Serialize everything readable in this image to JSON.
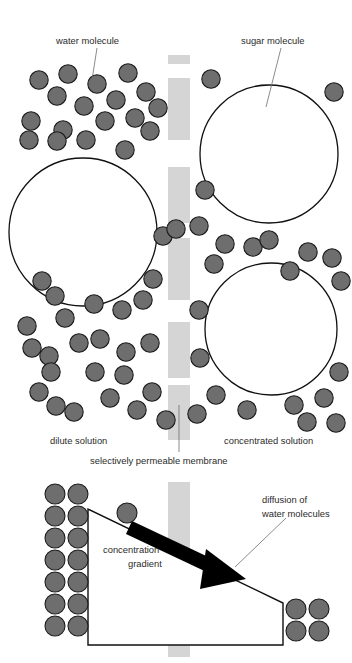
{
  "figure": {
    "canvas": {
      "width": 352,
      "height": 663,
      "background": "#ffffff"
    }
  },
  "colors": {
    "molecule_fill": "#6e6e6e",
    "molecule_stroke": "#1c1c1c",
    "membrane_fill": "#d5d5d5",
    "sugar_fill": "#ffffff",
    "sugar_stroke": "#101010",
    "arrow_fill": "#000000",
    "text": "#2b2b2b",
    "leader_line": "#6d6d6d"
  },
  "labels": {
    "water_molecule": "water molecule",
    "sugar_molecule": "sugar molecule",
    "dilute_solution": "dilute solution",
    "concentrated_solution": "concentrated solution",
    "membrane": "selectively permeable membrane",
    "concentration_gradient_line1": "concentration",
    "concentration_gradient_line2": "gradient",
    "diffusion_line1": "diffusion of",
    "diffusion_line2": "water molecules"
  },
  "top_panel": {
    "description": "Two compartments separated by a segmented selectively permeable membrane. Left compartment is dilute (many water molecules, one large sugar molecule). Right compartment is concentrated (two large sugar molecules, fewer water molecules).",
    "dilute_water_count": 44,
    "concentrated_water_count": 22,
    "dilute_sugar_count": 1,
    "concentrated_sugar_count": 2,
    "membrane_x": 168,
    "membrane_width": 22,
    "membrane_segments": [
      {
        "y": 55,
        "height": 9
      },
      {
        "y": 78,
        "height": 62
      },
      {
        "y": 167,
        "height": 56
      },
      {
        "y": 238,
        "height": 62
      },
      {
        "y": 322,
        "height": 56
      },
      {
        "y": 385,
        "height": 55
      }
    ],
    "sugar_molecules": [
      {
        "cx": 83,
        "cy": 232,
        "r": 74
      },
      {
        "cx": 269,
        "cy": 154,
        "r": 69
      },
      {
        "cx": 271,
        "cy": 329,
        "r": 66
      }
    ],
    "water_molecules_left": [
      {
        "cx": 39,
        "cy": 80
      },
      {
        "cx": 68,
        "cy": 74
      },
      {
        "cx": 97,
        "cy": 84
      },
      {
        "cx": 128,
        "cy": 73
      },
      {
        "cx": 57,
        "cy": 96
      },
      {
        "cx": 84,
        "cy": 106
      },
      {
        "cx": 116,
        "cy": 100
      },
      {
        "cx": 146,
        "cy": 92
      },
      {
        "cx": 31,
        "cy": 121
      },
      {
        "cx": 63,
        "cy": 130
      },
      {
        "cx": 74,
        "cy": 126
      },
      {
        "cx": 105,
        "cy": 121
      },
      {
        "cx": 135,
        "cy": 118
      },
      {
        "cx": 158,
        "cy": 108
      },
      {
        "cx": 29,
        "cy": 140
      },
      {
        "cx": 57,
        "cy": 139
      },
      {
        "cx": 86,
        "cy": 138
      },
      {
        "cx": 150,
        "cy": 131
      },
      {
        "cx": 125,
        "cy": 150
      },
      {
        "cx": 42,
        "cy": 281
      },
      {
        "cx": 55,
        "cy": 296
      },
      {
        "cx": 27,
        "cy": 326
      },
      {
        "cx": 65,
        "cy": 318
      },
      {
        "cx": 94,
        "cy": 304
      },
      {
        "cx": 122,
        "cy": 310
      },
      {
        "cx": 143,
        "cy": 300
      },
      {
        "cx": 153,
        "cy": 279
      },
      {
        "cx": 32,
        "cy": 348
      },
      {
        "cx": 49,
        "cy": 356
      },
      {
        "cx": 100,
        "cy": 339
      },
      {
        "cx": 126,
        "cy": 352
      },
      {
        "cx": 150,
        "cy": 343
      },
      {
        "cx": 79,
        "cy": 343
      },
      {
        "cx": 51,
        "cy": 372
      },
      {
        "cx": 95,
        "cy": 372
      },
      {
        "cx": 124,
        "cy": 375
      },
      {
        "cx": 39,
        "cy": 392
      },
      {
        "cx": 56,
        "cy": 406
      },
      {
        "cx": 110,
        "cy": 398
      },
      {
        "cx": 137,
        "cy": 410
      },
      {
        "cx": 152,
        "cy": 392
      },
      {
        "cx": 74,
        "cy": 412
      },
      {
        "cx": 163,
        "cy": 236
      },
      {
        "cx": 166,
        "cy": 420
      }
    ],
    "water_molecules_right": [
      {
        "cx": 211,
        "cy": 79
      },
      {
        "cx": 334,
        "cy": 92
      },
      {
        "cx": 199,
        "cy": 226
      },
      {
        "cx": 214,
        "cy": 264
      },
      {
        "cx": 242,
        "cy": 247
      },
      {
        "cx": 269,
        "cy": 240
      },
      {
        "cx": 332,
        "cy": 258
      },
      {
        "cx": 308,
        "cy": 252
      },
      {
        "cx": 290,
        "cy": 271
      },
      {
        "cx": 219,
        "cy": 285
      },
      {
        "cx": 341,
        "cy": 281
      },
      {
        "cx": 199,
        "cy": 310
      },
      {
        "cx": 200,
        "cy": 358
      },
      {
        "cx": 216,
        "cy": 395
      },
      {
        "cx": 247,
        "cy": 410
      },
      {
        "cx": 294,
        "cy": 405
      },
      {
        "cx": 324,
        "cy": 398
      },
      {
        "cx": 339,
        "cy": 372
      },
      {
        "cx": 307,
        "cy": 422
      },
      {
        "cx": 336,
        "cy": 423
      },
      {
        "cx": 197,
        "cy": 414
      },
      {
        "cx": 253,
        "cy": 194
      }
    ]
  },
  "bottom_panel": {
    "description": "Concentration gradient wedge with a thick black arrow showing diffusion of water molecules from the dilute side down the gradient across the membrane to the concentrated side.",
    "left_stack_rows": 7,
    "left_stack_cols": 2,
    "right_stack_rows": 2,
    "right_stack_cols": 2,
    "membrane_x": 168,
    "membrane_width": 22,
    "membrane_y": 482,
    "membrane_height": 175,
    "gradient_polygon": "88,509 88,645 283,645 283,603",
    "arrow_from": {
      "x": 138,
      "y": 527
    },
    "arrow_to": {
      "x": 248,
      "y": 579
    },
    "loose_molecule": {
      "cx": 127,
      "cy": 513
    }
  }
}
